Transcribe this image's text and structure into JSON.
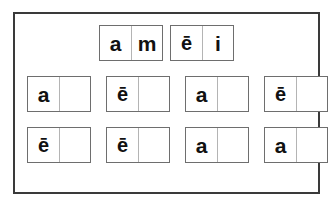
{
  "title": "Worksheet 1",
  "colors": {
    "page_background": "#ffffff",
    "frame_border": "#3a3a3a",
    "box_border": "#6e6e6e",
    "cell_divider": "#b4b4b4",
    "letter_text": "#111111"
  },
  "worksheet": {
    "rows": [
      {
        "row_label": "row-1",
        "boxes": [
          {
            "box_label": "word-box-1",
            "cells": [
              "a",
              "m"
            ]
          },
          {
            "box_label": "word-box-2",
            "cells": [
              "ē",
              "i"
            ]
          }
        ]
      },
      {
        "row_label": "row-2",
        "boxes": [
          {
            "box_label": "word-box-3",
            "cells": [
              "a",
              ""
            ]
          },
          {
            "box_label": "word-box-4",
            "cells": [
              "ē",
              ""
            ]
          },
          {
            "box_label": "word-box-5",
            "cells": [
              "a",
              ""
            ]
          },
          {
            "box_label": "word-box-6",
            "cells": [
              "ē",
              ""
            ]
          }
        ]
      },
      {
        "row_label": "row-3",
        "boxes": [
          {
            "box_label": "word-box-7",
            "cells": [
              "ē",
              ""
            ]
          },
          {
            "box_label": "word-box-8",
            "cells": [
              "ē",
              ""
            ]
          },
          {
            "box_label": "word-box-9",
            "cells": [
              "a",
              ""
            ]
          },
          {
            "box_label": "word-box-10",
            "cells": [
              "a",
              ""
            ]
          }
        ]
      }
    ]
  }
}
